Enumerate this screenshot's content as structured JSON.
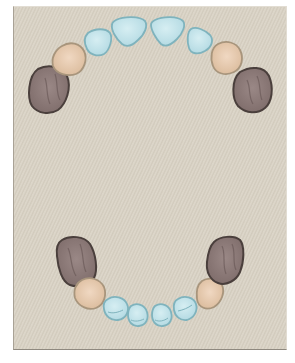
{
  "diagram": {
    "background_color": "#d8d1c3",
    "colors": {
      "incisor_fill": "#bfe1e8",
      "incisor_stroke": "#7fb3bd",
      "canine_fill": "#e6c8ac",
      "canine_stroke": "#a8957c",
      "molar_fill": "#8d7a78",
      "molar_stroke": "#4a3f3c"
    },
    "upper_arch": {
      "teeth": [
        {
          "type": "molar",
          "side": "right"
        },
        {
          "type": "canine",
          "side": "right"
        },
        {
          "type": "lateral-incisor",
          "side": "right"
        },
        {
          "type": "central-incisor",
          "side": "right"
        },
        {
          "type": "central-incisor",
          "side": "left"
        },
        {
          "type": "lateral-incisor",
          "side": "left"
        },
        {
          "type": "canine",
          "side": "left"
        },
        {
          "type": "molar",
          "side": "left"
        }
      ]
    },
    "lower_arch": {
      "teeth": [
        {
          "type": "molar",
          "side": "right"
        },
        {
          "type": "canine",
          "side": "right"
        },
        {
          "type": "lateral-incisor",
          "side": "right"
        },
        {
          "type": "central-incisor",
          "side": "right"
        },
        {
          "type": "central-incisor",
          "side": "left"
        },
        {
          "type": "lateral-incisor",
          "side": "left"
        },
        {
          "type": "canine",
          "side": "left"
        },
        {
          "type": "molar",
          "side": "left"
        }
      ]
    }
  }
}
